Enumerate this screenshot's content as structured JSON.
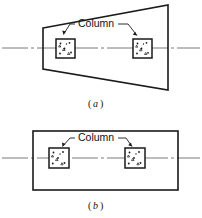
{
  "figure": {
    "colors": {
      "ink": "#1a1a1a",
      "centerline": "#6b6b6b",
      "paper": "#ffffff"
    },
    "panels": [
      {
        "id": "a",
        "subcaption": "a",
        "subcaption_open": "(",
        "subcaption_close": ")",
        "shape": "trapezoid",
        "annotation_label": "Column",
        "outline_points": "43,28 168,5 168,90 43,69",
        "centerline": {
          "y": 48,
          "x_start": 2,
          "x_end": 200,
          "dash": "26 3 3 3"
        },
        "columns": [
          {
            "name": "left-column",
            "x": 56,
            "y": 39,
            "size": 19
          },
          {
            "name": "right-column",
            "x": 133,
            "y": 39,
            "size": 19
          }
        ],
        "label": {
          "x": 78,
          "y": 26,
          "text": "Column"
        },
        "leaders": [
          {
            "name": "left-leader",
            "path": "M 75,24 L 70,24 L 63,35"
          },
          {
            "name": "right-leader",
            "path": "M 116,24 L 127,24 L 137,36"
          }
        ],
        "caption_pos": {
          "x": 101,
          "y": 104
        }
      },
      {
        "id": "b",
        "subcaption": "b",
        "subcaption_open": "(",
        "subcaption_close": ")",
        "shape": "rectangle",
        "annotation_label": "Column",
        "outline_points": "33,131 178,131 178,190 33,190",
        "centerline": {
          "y": 158,
          "x_start": 2,
          "x_end": 200,
          "dash": "26 3 3 3"
        },
        "columns": [
          {
            "name": "left-column",
            "x": 49,
            "y": 148,
            "size": 20
          },
          {
            "name": "right-column",
            "x": 125,
            "y": 148,
            "size": 20
          }
        ],
        "label": {
          "x": 78,
          "y": 141,
          "text": "Column"
        },
        "leaders": [
          {
            "name": "left-leader",
            "path": "M 75,138 L 70,138 L 62,146"
          },
          {
            "name": "right-leader",
            "path": "M 116,138 L 126,138 L 132,146"
          }
        ],
        "caption_pos": {
          "x": 101,
          "y": 207
        }
      }
    ]
  }
}
